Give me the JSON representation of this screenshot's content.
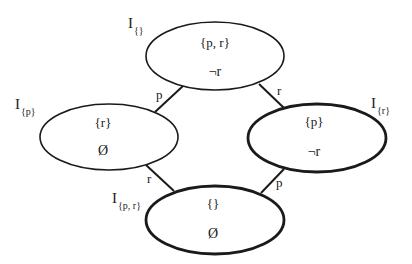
{
  "diagram": {
    "nodes": [
      {
        "id": "top",
        "set": "{p, r}",
        "value": "¬r",
        "label_main": "I",
        "label_sub": "{}",
        "emphasis": "normal"
      },
      {
        "id": "left",
        "set": "{r}",
        "value": "Ø",
        "label_main": "I",
        "label_sub": "{p}",
        "emphasis": "normal"
      },
      {
        "id": "right",
        "set": "{p}",
        "value": "¬r",
        "label_main": "I",
        "label_sub": "{r}",
        "emphasis": "bold"
      },
      {
        "id": "bottom",
        "set": "{}",
        "value": "Ø",
        "label_main": "I",
        "label_sub": "{p, r}",
        "emphasis": "bold"
      }
    ],
    "edges": [
      {
        "from": "top",
        "to": "left",
        "label": "p"
      },
      {
        "from": "top",
        "to": "right",
        "label": "r"
      },
      {
        "from": "left",
        "to": "bottom",
        "label": "r"
      },
      {
        "from": "right",
        "to": "bottom",
        "label": "p"
      }
    ]
  }
}
